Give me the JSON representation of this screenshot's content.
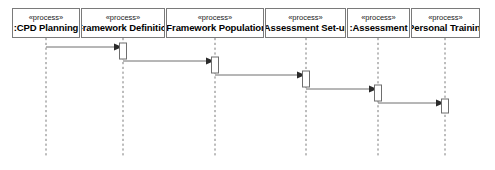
{
  "diagram": {
    "kind": "uml-sequence-diagram",
    "width": 495,
    "height": 170,
    "background_color": "#ffffff",
    "line_color": "#7a7a7a",
    "message_line_color": "#6e6e6e",
    "text_color": "#000000",
    "lifeline_top": 38,
    "lifeline_bottom": 158,
    "head_box_top": 8,
    "head_box_height": 30,
    "participants": [
      {
        "id": "cpd-planning",
        "stereotype": "«process»",
        "name": ":CPD Planning",
        "box_left": 12,
        "box_width": 68,
        "lifeline_x": 46
      },
      {
        "id": "framework-definition",
        "stereotype": "«process»",
        "name": ":Framework Definition",
        "box_left": 81,
        "box_width": 84,
        "lifeline_x": 123
      },
      {
        "id": "framework-population",
        "stereotype": "«process»",
        "name": ":Framework Population",
        "box_left": 166,
        "box_width": 98,
        "lifeline_x": 215
      },
      {
        "id": "assessment-set-up",
        "stereotype": "«process»",
        "name": ":Assessment Set-up",
        "box_left": 265,
        "box_width": 81,
        "lifeline_x": 306
      },
      {
        "id": "assessment",
        "stereotype": "«process»",
        "name": ":Assessment",
        "box_left": 347,
        "box_width": 63,
        "lifeline_x": 378
      },
      {
        "id": "personal-training",
        "stereotype": "«process»",
        "name": ":Personal Training",
        "box_left": 411,
        "box_width": 69,
        "lifeline_x": 445
      }
    ],
    "messages": [
      {
        "index": 1,
        "label": "",
        "from": "cpd-planning",
        "to": "framework-definition",
        "from_x": 46,
        "to_x": 123,
        "y": 47,
        "type": "synchronous-call"
      },
      {
        "index": 2,
        "label": "",
        "from": "framework-definition",
        "to": "framework-population",
        "from_x": 123,
        "to_x": 215,
        "y": 61,
        "type": "synchronous-call"
      },
      {
        "index": 3,
        "label": "",
        "from": "framework-population",
        "to": "assessment-set-up",
        "from_x": 215,
        "to_x": 306,
        "y": 75,
        "type": "synchronous-call"
      },
      {
        "index": 4,
        "label": "",
        "from": "assessment-set-up",
        "to": "assessment",
        "from_x": 306,
        "to_x": 378,
        "y": 89,
        "type": "synchronous-call"
      },
      {
        "index": 5,
        "label": "",
        "from": "assessment",
        "to": "personal-training",
        "from_x": 378,
        "to_x": 445,
        "y": 103,
        "type": "synchronous-call"
      }
    ],
    "activations": [
      {
        "on": "framework-definition",
        "x": 123,
        "y": 43,
        "width": 7,
        "height": 16
      },
      {
        "on": "framework-population",
        "x": 215,
        "y": 57,
        "width": 7,
        "height": 16
      },
      {
        "on": "assessment-set-up",
        "x": 306,
        "y": 71,
        "width": 7,
        "height": 16
      },
      {
        "on": "assessment",
        "x": 378,
        "y": 85,
        "width": 7,
        "height": 16
      },
      {
        "on": "personal-training",
        "x": 445,
        "y": 99,
        "width": 7,
        "height": 14
      }
    ]
  }
}
